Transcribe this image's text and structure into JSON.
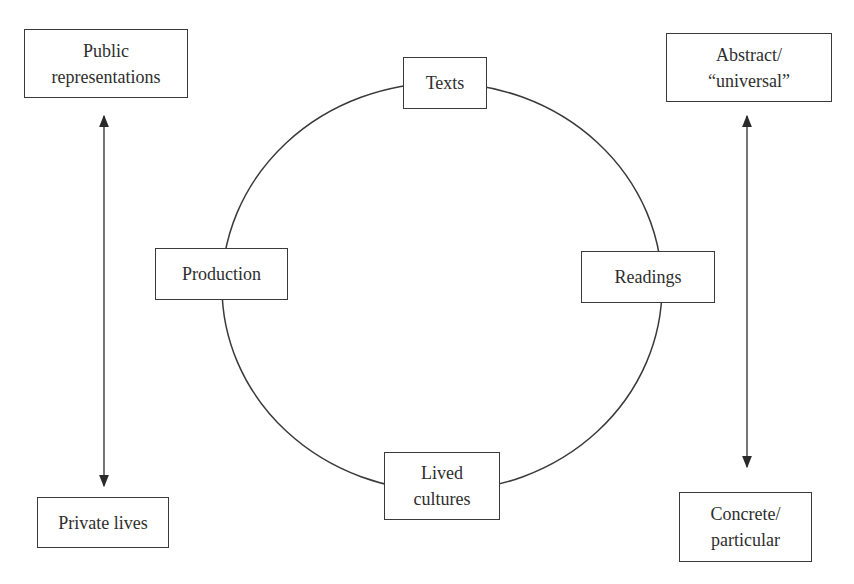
{
  "diagram": {
    "type": "circuit-of-culture",
    "cycle_nodes": {
      "texts": {
        "label": "Texts"
      },
      "readings": {
        "label": "Readings"
      },
      "lived_cultures": {
        "line1": "Lived",
        "line2": "cultures"
      },
      "production": {
        "label": "Production"
      }
    },
    "left_axis": {
      "top": {
        "line1": "Public",
        "line2": "representations"
      },
      "bottom": {
        "label": "Private lives"
      }
    },
    "right_axis": {
      "top": {
        "line1": "Abstract/",
        "line2": "“universal”"
      },
      "bottom": {
        "line1": "Concrete/",
        "line2": "particular"
      }
    },
    "colors": {
      "line": "#3a3a3a",
      "text": "#2e2e2e",
      "background": "#ffffff"
    }
  }
}
